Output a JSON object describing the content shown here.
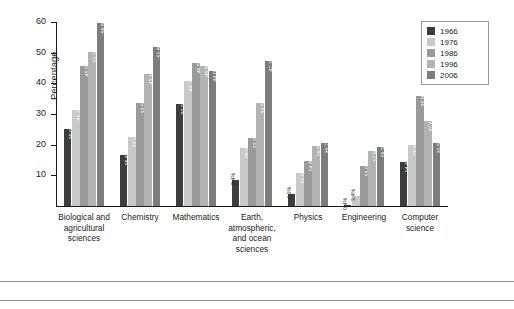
{
  "chart_data": {
    "type": "bar",
    "title": "",
    "xlabel": "",
    "ylabel": "Percentage",
    "ylim": [
      0,
      60
    ],
    "ytick_values": [
      0,
      10,
      20,
      30,
      40,
      50,
      60
    ],
    "ytick_labels": [
      "0",
      "10",
      "20",
      "30",
      "40",
      "50",
      "60"
    ],
    "grid": false,
    "legend_position": "top-right",
    "categories": [
      "Biological and agricultural sciences",
      "Chemistry",
      "Mathematics",
      "Earth, atmospheric, and ocean sciences",
      "Physics",
      "Engineering",
      "Computer science"
    ],
    "category_lines": [
      [
        "Biological and",
        "agricultural",
        "sciences"
      ],
      [
        "Chemistry"
      ],
      [
        "Mathematics"
      ],
      [
        "Earth,",
        "atmospheric,",
        "and ocean",
        "sciences"
      ],
      [
        "Physics"
      ],
      [
        "Engineering"
      ],
      [
        "Computer",
        "science"
      ]
    ],
    "series": [
      {
        "name": "1966",
        "color": "#3c3c3c",
        "values": [
          25.0,
          16.5,
          33.3,
          8.4,
          4.0,
          0.4,
          14.4
        ],
        "labels": [
          "25.0%",
          "16.5%",
          "33.3%",
          "8.4%",
          "4.0%",
          "0.4%",
          "14.4%"
        ]
      },
      {
        "name": "1976",
        "color": "#c9c9c9",
        "values": [
          31.2,
          22.5,
          40.7,
          18.9,
          10.9,
          3.4,
          19.8
        ],
        "labels": [
          "31.2%",
          "22.5%",
          "40.7%",
          "18.9%",
          "10.9%",
          "3.4%",
          "19.8%"
        ]
      },
      {
        "name": "1986",
        "color": "#9a9a9a",
        "values": [
          45.5,
          33.5,
          46.5,
          22.2,
          14.8,
          13.0,
          35.8
        ],
        "labels": [
          "45.5%",
          "33.5%",
          "46.5%",
          "22.2%",
          "14.8%",
          "13.0%",
          "35.8%"
        ]
      },
      {
        "name": "1996",
        "color": "#b3b3b3",
        "values": [
          50.2,
          43.1,
          45.8,
          33.5,
          19.5,
          17.9,
          27.6
        ],
        "labels": [
          "50.2%",
          "43.1%",
          "45.8%",
          "33.5%",
          "19.5%",
          "17.9%",
          "27.6%"
        ]
      },
      {
        "name": "2006",
        "color": "#7d7d7d",
        "values": [
          59.8,
          51.8,
          44.0,
          47.2,
          20.7,
          19.3,
          20.5
        ],
        "labels": [
          "59.8%",
          "51.8%",
          "44.0%",
          "47.2%",
          "20.7%",
          "19.3%",
          "20.5%"
        ]
      }
    ]
  }
}
